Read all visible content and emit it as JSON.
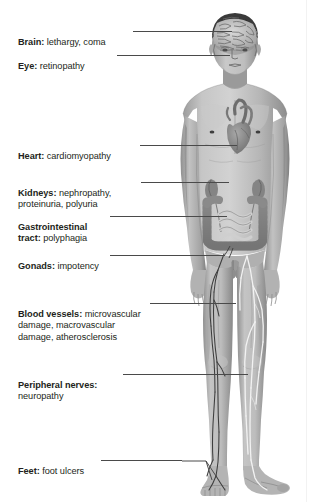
{
  "diagram": {
    "background_color": "#ffffff",
    "text_color": "#231f20",
    "leader_line_color": "#4a4a4a",
    "skin_tone": "#b9b9b9",
    "organ_tone": "#8e8e8e",
    "vessel_color": "#3d3d3d",
    "nerve_color": "#f4f4f4"
  },
  "labels": [
    {
      "id": "brain",
      "term": "Brain:",
      "desc": " lethargy, coma",
      "x": 18,
      "y": 25,
      "leader": {
        "x": 133,
        "y": 31,
        "width": 99
      },
      "target": "brain"
    },
    {
      "id": "eye",
      "term": "Eye:",
      "desc": " retinopathy",
      "x": 18,
      "y": 49,
      "leader": {
        "x": 117,
        "y": 55,
        "width": 113
      },
      "target": "eye"
    },
    {
      "id": "heart",
      "term": "Heart:",
      "desc": " cardiomyopathy",
      "x": 18,
      "y": 139,
      "leader": {
        "x": 140,
        "y": 145,
        "width": 97
      },
      "target": "heart"
    },
    {
      "id": "kidneys",
      "term": "Kidneys:",
      "desc": " nephropathy,\nproteinuria, polyuria",
      "x": 18,
      "y": 176,
      "leader": {
        "x": 141,
        "y": 182,
        "width": 88
      },
      "target": "kidneys"
    },
    {
      "id": "gastrointestinal",
      "term": "Gastrointestinal\ntract:",
      "desc": " polyphagia",
      "x": 18,
      "y": 210,
      "leader": {
        "x": 110,
        "y": 216,
        "width": 117
      },
      "target": "intestines"
    },
    {
      "id": "gonads",
      "term": "Gonads:",
      "desc": " impotency",
      "x": 18,
      "y": 249,
      "leader": {
        "x": 110,
        "y": 255,
        "width": 115
      },
      "target": "gonads"
    },
    {
      "id": "blood-vessels",
      "term": "Blood vessels:",
      "desc": " microvascular\ndamage, macrovascular\ndamage, atherosclerosis",
      "x": 18,
      "y": 297,
      "leader": {
        "x": 150,
        "y": 303,
        "width": 86
      },
      "target": "leg-arteries"
    },
    {
      "id": "peripheral-nerves",
      "term": "Peripheral nerves:",
      "desc": "\nneuropathy",
      "x": 18,
      "y": 368,
      "leader": {
        "x": 123,
        "y": 374,
        "width": 125
      },
      "target": "leg-nerves"
    },
    {
      "id": "feet",
      "term": "Feet:",
      "desc": " foot ulcers",
      "x": 18,
      "y": 454,
      "leader": {
        "x": 101,
        "y": 460,
        "width": 81
      },
      "target": "foot",
      "has_diagonal": true
    }
  ],
  "anatomy_parts": [
    {
      "name": "brain",
      "label": "cerebral cortex shown through skull"
    },
    {
      "name": "heart",
      "label": "heart with great vessels"
    },
    {
      "name": "kidneys",
      "label": "left and right kidney"
    },
    {
      "name": "intestines",
      "label": "large and small intestine"
    },
    {
      "name": "gonads",
      "label": "testes / genitals"
    },
    {
      "name": "leg-arteries",
      "label": "arteries of left leg"
    },
    {
      "name": "leg-nerves",
      "label": "nerves of right leg"
    },
    {
      "name": "foot",
      "label": "left foot"
    }
  ]
}
